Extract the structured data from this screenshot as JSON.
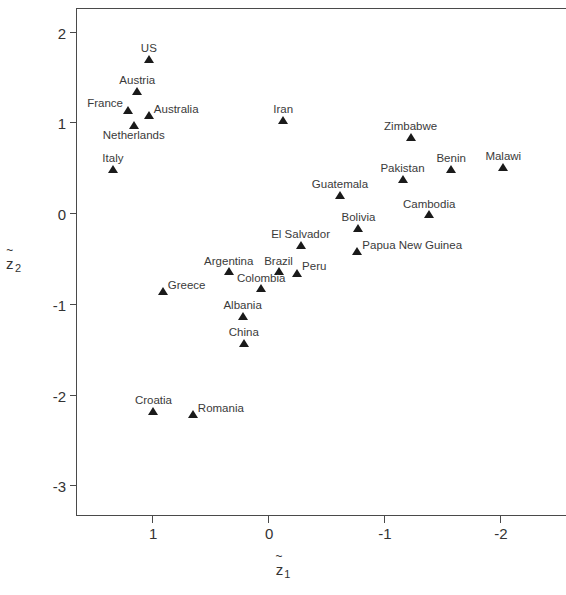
{
  "chart_data": {
    "type": "scatter",
    "title": "",
    "xlabel": "z̃₁",
    "ylabel": "z̃₂",
    "xlabel_base": "z",
    "xlabel_sub": "1",
    "ylabel_base": "z",
    "ylabel_sub": "2",
    "xlim": [
      1.65,
      -2.58
    ],
    "ylim": [
      -3.35,
      2.25
    ],
    "x_reversed": true,
    "grid": false,
    "legend": null,
    "xticks": [
      1,
      0,
      -1,
      -2
    ],
    "xtick_labels": [
      "1",
      "0",
      "-1",
      "-2"
    ],
    "yticks": [
      2,
      1,
      0,
      -1,
      -2,
      -3
    ],
    "ytick_labels": [
      "2",
      "1",
      "0",
      "-1",
      "-2",
      "-3"
    ],
    "marker": "filled-triangle",
    "marker_color": "#1a1a1a",
    "points": [
      {
        "label": "US",
        "x": 1.03,
        "y": 1.7,
        "lab": "lab-center"
      },
      {
        "label": "Austria",
        "x": 1.13,
        "y": 1.35,
        "lab": "lab-center"
      },
      {
        "label": "France",
        "x": 1.21,
        "y": 1.14,
        "lab": "lab-farleft"
      },
      {
        "label": "Australia",
        "x": 1.03,
        "y": 1.08,
        "lab": "lab-farright"
      },
      {
        "label": "Netherlands",
        "x": 1.16,
        "y": 0.97,
        "lab": "lab-below"
      },
      {
        "label": "Italy",
        "x": 1.34,
        "y": 0.49,
        "lab": "lab-center"
      },
      {
        "label": "Iran",
        "x": -0.13,
        "y": 1.03,
        "lab": "lab-center"
      },
      {
        "label": "Zimbabwe",
        "x": -1.23,
        "y": 0.84,
        "lab": "lab-center"
      },
      {
        "label": "Benin",
        "x": -1.58,
        "y": 0.49,
        "lab": "lab-center"
      },
      {
        "label": "Malawi",
        "x": -2.03,
        "y": 0.51,
        "lab": "lab-center"
      },
      {
        "label": "Pakistan",
        "x": -1.16,
        "y": 0.38,
        "lab": "lab-center"
      },
      {
        "label": "Guatemala",
        "x": -0.62,
        "y": 0.2,
        "lab": "lab-center"
      },
      {
        "label": "Cambodia",
        "x": -1.39,
        "y": -0.01,
        "lab": "lab-center"
      },
      {
        "label": "Bolivia",
        "x": -0.78,
        "y": -0.16,
        "lab": "lab-center"
      },
      {
        "label": "El Salvador",
        "x": -0.28,
        "y": -0.35,
        "lab": "lab-center"
      },
      {
        "label": "Papua New Guinea",
        "x": -0.77,
        "y": -0.42,
        "lab": "lab-farright"
      },
      {
        "label": "Argentina",
        "x": 0.34,
        "y": -0.64,
        "lab": "lab-center"
      },
      {
        "label": "Brazil",
        "x": -0.09,
        "y": -0.64,
        "lab": "lab-center"
      },
      {
        "label": "Peru",
        "x": -0.25,
        "y": -0.66,
        "lab": "lab-farright"
      },
      {
        "label": "Colombia",
        "x": 0.06,
        "y": -0.83,
        "lab": "lab-center"
      },
      {
        "label": "Greece",
        "x": 0.91,
        "y": -0.86,
        "lab": "lab-farright"
      },
      {
        "label": "Albania",
        "x": 0.22,
        "y": -1.13,
        "lab": "lab-center"
      },
      {
        "label": "China",
        "x": 0.21,
        "y": -1.43,
        "lab": "lab-center"
      },
      {
        "label": "Croatia",
        "x": 0.99,
        "y": -2.18,
        "lab": "lab-center"
      },
      {
        "label": "Romania",
        "x": 0.65,
        "y": -2.22,
        "lab": "lab-farright"
      }
    ]
  }
}
